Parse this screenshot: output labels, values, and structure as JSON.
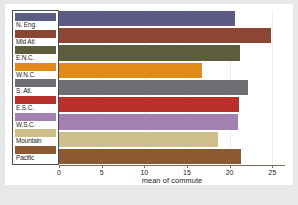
{
  "chart_data": {
    "type": "bar",
    "orientation": "horizontal",
    "title": "",
    "xlabel": "mean of commute",
    "ylabel": "",
    "xlim": [
      0,
      26.5
    ],
    "xticks": [
      0,
      5,
      10,
      15,
      20,
      25
    ],
    "xticklabels": [
      "0",
      "5",
      "10",
      "15",
      "20",
      "25"
    ],
    "grid": true,
    "legend_position": "left",
    "categories": [
      "N. Eng.",
      "Mid Atl",
      "E.N.C.",
      "W.N.C.",
      "S. Atl.",
      "E.S.C.",
      "W.S.C.",
      "Mountain",
      "Pacific"
    ],
    "values": [
      20.6,
      24.8,
      21.2,
      16.8,
      22.2,
      21.1,
      21.0,
      18.6,
      21.3
    ],
    "colors": [
      "#5b5b84",
      "#8c4734",
      "#5b5d3d",
      "#e18a18",
      "#6f6f73",
      "#b8302a",
      "#a280b2",
      "#ccc088",
      "#8b5a32"
    ],
    "series": [
      {
        "name": "mean of commute",
        "points": [
          {
            "label": "N. Eng.",
            "value": 20.6,
            "color": "#5b5b84"
          },
          {
            "label": "Mid Atl",
            "value": 24.8,
            "color": "#8c4734"
          },
          {
            "label": "E.N.C.",
            "value": 21.2,
            "color": "#5b5d3d"
          },
          {
            "label": "W.N.C.",
            "value": 16.8,
            "color": "#e18a18"
          },
          {
            "label": "S. Atl.",
            "value": 22.2,
            "color": "#6f6f73"
          },
          {
            "label": "E.S.C.",
            "value": 21.1,
            "color": "#b8302a"
          },
          {
            "label": "W.S.C.",
            "value": 21.0,
            "color": "#a280b2"
          },
          {
            "label": "Mountain",
            "value": 18.6,
            "color": "#ccc088"
          },
          {
            "label": "Pacific",
            "value": 21.3,
            "color": "#8b5a32"
          }
        ]
      }
    ]
  },
  "legend": {
    "items": [
      {
        "label": "N. Eng.",
        "color": "#5b5b84"
      },
      {
        "label": "Mid Atl",
        "color": "#8c4734"
      },
      {
        "label": "E.N.C.",
        "color": "#5b5d3d"
      },
      {
        "label": "W.N.C.",
        "color": "#e18a18"
      },
      {
        "label": "S. Atl.",
        "color": "#6f6f73"
      },
      {
        "label": "E.S.C.",
        "color": "#b8302a"
      },
      {
        "label": "W.S.C.",
        "color": "#a280b2"
      },
      {
        "label": "Mountain",
        "color": "#ccc088"
      },
      {
        "label": "Pacific",
        "color": "#8b5a32"
      }
    ]
  },
  "theme": {
    "page_background": "#e6e8ea",
    "plot_background": "#ffffff",
    "axis_color": "#7c6a5a",
    "grid_color": "#eceff1",
    "text_color": "#1a1a1a",
    "legend_border": "#4d4d4d"
  }
}
